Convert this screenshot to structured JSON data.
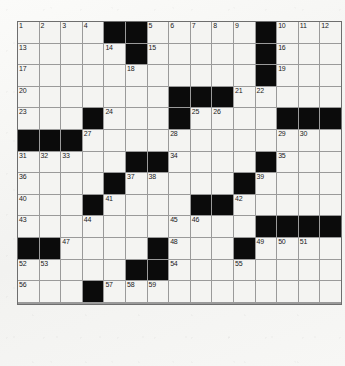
{
  "puzzle": {
    "title": "Crossword Grid",
    "type": "crossword",
    "columns": 15,
    "rows": 13,
    "cell_size": 20.6,
    "colors": {
      "page_background": "#f6f6f4",
      "cell_fill": "#f4f4f2",
      "block_fill": "#0b0b0b",
      "grid_line": "#9a9a9a",
      "border": "#6e6e6e",
      "number_text": "#1a1a1a"
    },
    "legend": {
      "white_cell": "open-letter-square",
      "black_cell": "blocked-square"
    },
    "grid": [
      [
        {
          "block": false,
          "num": "1"
        },
        {
          "block": false,
          "num": "2"
        },
        {
          "block": false,
          "num": "3"
        },
        {
          "block": false,
          "num": "4"
        },
        {
          "block": true,
          "num": ""
        },
        {
          "block": true,
          "num": ""
        },
        {
          "block": false,
          "num": "5"
        },
        {
          "block": false,
          "num": "6"
        },
        {
          "block": false,
          "num": "7"
        },
        {
          "block": false,
          "num": "8"
        },
        {
          "block": false,
          "num": "9"
        },
        {
          "block": true,
          "num": ""
        },
        {
          "block": false,
          "num": "10"
        },
        {
          "block": false,
          "num": "11"
        },
        {
          "block": false,
          "num": "12"
        }
      ],
      [
        {
          "block": false,
          "num": "13"
        },
        {
          "block": false,
          "num": ""
        },
        {
          "block": false,
          "num": ""
        },
        {
          "block": false,
          "num": ""
        },
        {
          "block": false,
          "num": "14"
        },
        {
          "block": true,
          "num": ""
        },
        {
          "block": false,
          "num": "15"
        },
        {
          "block": false,
          "num": ""
        },
        {
          "block": false,
          "num": ""
        },
        {
          "block": false,
          "num": ""
        },
        {
          "block": false,
          "num": ""
        },
        {
          "block": true,
          "num": ""
        },
        {
          "block": false,
          "num": "16"
        },
        {
          "block": false,
          "num": ""
        },
        {
          "block": false,
          "num": ""
        }
      ],
      [
        {
          "block": false,
          "num": "17"
        },
        {
          "block": false,
          "num": ""
        },
        {
          "block": false,
          "num": ""
        },
        {
          "block": false,
          "num": ""
        },
        {
          "block": false,
          "num": ""
        },
        {
          "block": false,
          "num": "18"
        },
        {
          "block": false,
          "num": ""
        },
        {
          "block": false,
          "num": ""
        },
        {
          "block": false,
          "num": ""
        },
        {
          "block": false,
          "num": ""
        },
        {
          "block": false,
          "num": ""
        },
        {
          "block": true,
          "num": ""
        },
        {
          "block": false,
          "num": "19"
        },
        {
          "block": false,
          "num": ""
        },
        {
          "block": false,
          "num": ""
        }
      ],
      [
        {
          "block": false,
          "num": "20"
        },
        {
          "block": false,
          "num": ""
        },
        {
          "block": false,
          "num": ""
        },
        {
          "block": false,
          "num": ""
        },
        {
          "block": false,
          "num": ""
        },
        {
          "block": false,
          "num": ""
        },
        {
          "block": false,
          "num": ""
        },
        {
          "block": true,
          "num": ""
        },
        {
          "block": true,
          "num": ""
        },
        {
          "block": true,
          "num": ""
        },
        {
          "block": false,
          "num": "21"
        },
        {
          "block": false,
          "num": "22"
        },
        {
          "block": false,
          "num": ""
        },
        {
          "block": false,
          "num": ""
        },
        {
          "block": false,
          "num": ""
        }
      ],
      [
        {
          "block": false,
          "num": "23"
        },
        {
          "block": false,
          "num": ""
        },
        {
          "block": false,
          "num": ""
        },
        {
          "block": true,
          "num": ""
        },
        {
          "block": false,
          "num": "24"
        },
        {
          "block": false,
          "num": ""
        },
        {
          "block": false,
          "num": ""
        },
        {
          "block": true,
          "num": ""
        },
        {
          "block": false,
          "num": "25"
        },
        {
          "block": false,
          "num": "26"
        },
        {
          "block": false,
          "num": ""
        },
        {
          "block": false,
          "num": ""
        },
        {
          "block": true,
          "num": ""
        },
        {
          "block": true,
          "num": ""
        },
        {
          "block": true,
          "num": ""
        }
      ],
      [
        {
          "block": true,
          "num": ""
        },
        {
          "block": true,
          "num": ""
        },
        {
          "block": true,
          "num": ""
        },
        {
          "block": false,
          "num": "27"
        },
        {
          "block": false,
          "num": ""
        },
        {
          "block": false,
          "num": ""
        },
        {
          "block": false,
          "num": ""
        },
        {
          "block": false,
          "num": "28"
        },
        {
          "block": false,
          "num": ""
        },
        {
          "block": false,
          "num": ""
        },
        {
          "block": false,
          "num": ""
        },
        {
          "block": false,
          "num": ""
        },
        {
          "block": false,
          "num": "29"
        },
        {
          "block": false,
          "num": "30"
        },
        {
          "block": false,
          "num": ""
        }
      ],
      [
        {
          "block": false,
          "num": "31"
        },
        {
          "block": false,
          "num": "32"
        },
        {
          "block": false,
          "num": "33"
        },
        {
          "block": false,
          "num": ""
        },
        {
          "block": false,
          "num": ""
        },
        {
          "block": true,
          "num": ""
        },
        {
          "block": true,
          "num": ""
        },
        {
          "block": false,
          "num": "34"
        },
        {
          "block": false,
          "num": ""
        },
        {
          "block": false,
          "num": ""
        },
        {
          "block": false,
          "num": ""
        },
        {
          "block": true,
          "num": ""
        },
        {
          "block": false,
          "num": "35"
        },
        {
          "block": false,
          "num": ""
        },
        {
          "block": false,
          "num": ""
        }
      ],
      [
        {
          "block": false,
          "num": "36"
        },
        {
          "block": false,
          "num": ""
        },
        {
          "block": false,
          "num": ""
        },
        {
          "block": false,
          "num": ""
        },
        {
          "block": true,
          "num": ""
        },
        {
          "block": false,
          "num": "37"
        },
        {
          "block": false,
          "num": "38"
        },
        {
          "block": false,
          "num": ""
        },
        {
          "block": false,
          "num": ""
        },
        {
          "block": false,
          "num": ""
        },
        {
          "block": true,
          "num": ""
        },
        {
          "block": false,
          "num": "39"
        },
        {
          "block": false,
          "num": ""
        },
        {
          "block": false,
          "num": ""
        },
        {
          "block": false,
          "num": ""
        }
      ],
      [
        {
          "block": false,
          "num": "40"
        },
        {
          "block": false,
          "num": ""
        },
        {
          "block": false,
          "num": ""
        },
        {
          "block": true,
          "num": ""
        },
        {
          "block": false,
          "num": "41"
        },
        {
          "block": false,
          "num": ""
        },
        {
          "block": false,
          "num": ""
        },
        {
          "block": false,
          "num": ""
        },
        {
          "block": true,
          "num": ""
        },
        {
          "block": true,
          "num": ""
        },
        {
          "block": false,
          "num": "42"
        },
        {
          "block": false,
          "num": ""
        },
        {
          "block": false,
          "num": ""
        },
        {
          "block": false,
          "num": ""
        },
        {
          "block": false,
          "num": ""
        }
      ],
      [
        {
          "block": false,
          "num": "43"
        },
        {
          "block": false,
          "num": ""
        },
        {
          "block": false,
          "num": ""
        },
        {
          "block": false,
          "num": "44"
        },
        {
          "block": false,
          "num": ""
        },
        {
          "block": false,
          "num": ""
        },
        {
          "block": false,
          "num": ""
        },
        {
          "block": false,
          "num": "45"
        },
        {
          "block": false,
          "num": "46"
        },
        {
          "block": false,
          "num": ""
        },
        {
          "block": false,
          "num": ""
        },
        {
          "block": true,
          "num": ""
        },
        {
          "block": true,
          "num": ""
        },
        {
          "block": true,
          "num": ""
        },
        {
          "block": true,
          "num": ""
        }
      ],
      [
        {
          "block": true,
          "num": ""
        },
        {
          "block": true,
          "num": ""
        },
        {
          "block": false,
          "num": "47"
        },
        {
          "block": false,
          "num": ""
        },
        {
          "block": false,
          "num": ""
        },
        {
          "block": false,
          "num": ""
        },
        {
          "block": true,
          "num": ""
        },
        {
          "block": false,
          "num": "48"
        },
        {
          "block": false,
          "num": ""
        },
        {
          "block": false,
          "num": ""
        },
        {
          "block": true,
          "num": ""
        },
        {
          "block": false,
          "num": "49"
        },
        {
          "block": false,
          "num": "50"
        },
        {
          "block": false,
          "num": "51"
        },
        {
          "block": false,
          "num": ""
        }
      ],
      [
        {
          "block": false,
          "num": "52"
        },
        {
          "block": false,
          "num": "53"
        },
        {
          "block": false,
          "num": ""
        },
        {
          "block": false,
          "num": ""
        },
        {
          "block": false,
          "num": ""
        },
        {
          "block": true,
          "num": ""
        },
        {
          "block": true,
          "num": ""
        },
        {
          "block": false,
          "num": "54"
        },
        {
          "block": false,
          "num": ""
        },
        {
          "block": false,
          "num": ""
        },
        {
          "block": false,
          "num": "55"
        },
        {
          "block": false,
          "num": ""
        },
        {
          "block": false,
          "num": ""
        },
        {
          "block": false,
          "num": ""
        },
        {
          "block": false,
          "num": ""
        }
      ],
      [
        {
          "block": false,
          "num": "56"
        },
        {
          "block": false,
          "num": ""
        },
        {
          "block": false,
          "num": ""
        },
        {
          "block": true,
          "num": ""
        },
        {
          "block": false,
          "num": "57"
        },
        {
          "block": false,
          "num": "58"
        },
        {
          "block": false,
          "num": "59"
        },
        {
          "block": false,
          "num": ""
        },
        {
          "block": false,
          "num": ""
        },
        {
          "block": false,
          "num": ""
        },
        {
          "block": false,
          "num": ""
        },
        {
          "block": false,
          "num": ""
        },
        {
          "block": false,
          "num": ""
        },
        {
          "block": false,
          "num": ""
        },
        {
          "block": false,
          "num": ""
        }
      ],
      [
        {
          "block": false,
          "num": "60"
        },
        {
          "block": false,
          "num": ""
        },
        {
          "block": false,
          "num": ""
        },
        {
          "block": true,
          "num": ""
        },
        {
          "block": false,
          "num": "61"
        },
        {
          "block": false,
          "num": ""
        },
        {
          "block": false,
          "num": ""
        },
        {
          "block": false,
          "num": ""
        },
        {
          "block": true,
          "num": ""
        },
        {
          "block": false,
          "num": "62"
        },
        {
          "block": false,
          "num": ""
        },
        {
          "block": false,
          "num": ""
        },
        {
          "block": false,
          "num": ""
        },
        {
          "block": false,
          "num": ""
        },
        {
          "block": false,
          "num": ""
        }
      ],
      [
        {
          "block": false,
          "num": "63"
        },
        {
          "block": false,
          "num": ""
        },
        {
          "block": false,
          "num": ""
        },
        {
          "block": true,
          "num": ""
        },
        {
          "block": false,
          "num": "64"
        },
        {
          "block": false,
          "num": ""
        },
        {
          "block": false,
          "num": ""
        },
        {
          "block": false,
          "num": ""
        },
        {
          "block": true,
          "num": ""
        },
        {
          "block": true,
          "num": ""
        },
        {
          "block": false,
          "num": "65"
        },
        {
          "block": false,
          "num": ""
        },
        {
          "block": false,
          "num": ""
        },
        {
          "block": false,
          "num": ""
        },
        {
          "block": false,
          "num": ""
        }
      ]
    ]
  }
}
